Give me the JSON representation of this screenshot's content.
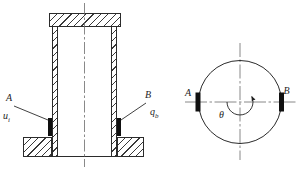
{
  "front_view": {
    "point_a": "A",
    "point_b": "B",
    "signal_a": {
      "base": "u",
      "sub": "i"
    },
    "signal_b": {
      "base": "q",
      "sub": "b"
    }
  },
  "top_view": {
    "point_a": "A",
    "point_b": "B",
    "angle": "θ"
  },
  "colors": {
    "line": "#2b2b2b",
    "centerline": "#6b6b6b",
    "sensor": "#101010",
    "background": "#ffffff"
  }
}
